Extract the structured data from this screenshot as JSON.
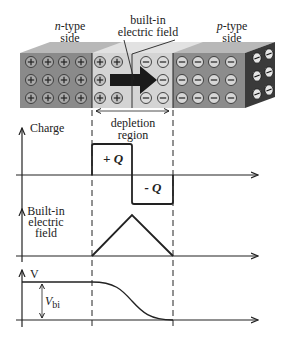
{
  "labels": {
    "n_side_line1_italic": "n",
    "n_side_line1_rest": "-type",
    "n_side_line2": "side",
    "field_line1": "built-in",
    "field_line2": "electric field",
    "p_side_line1_italic": "p",
    "p_side_line1_rest": "-type",
    "p_side_line2": "side",
    "depletion_line1": "depletion",
    "depletion_line2": "region",
    "charge_axis": "Charge",
    "plus_q": "+ Q",
    "minus_q": "- Q",
    "efield_line1": "Built-in",
    "efield_line2": "electric",
    "efield_line3": "field",
    "v_axis": "V",
    "vbi_main": "V",
    "vbi_sub": "bi"
  },
  "ions": {
    "n_side_symbol": "+",
    "p_side_symbol": "−",
    "n_neutral_columns": 4,
    "n_depletion_columns": 2,
    "p_depletion_columns": 2,
    "p_neutral_columns": 4,
    "rows": 3
  },
  "colors": {
    "n_region": "#8a8a8a",
    "depletion": "#d4d4d4",
    "p_region": "#8c8c8c",
    "side_face": "#3a3a3a",
    "top_face": "#b5b5b5",
    "arrow": "#1a1a1a",
    "line": "#222222"
  }
}
